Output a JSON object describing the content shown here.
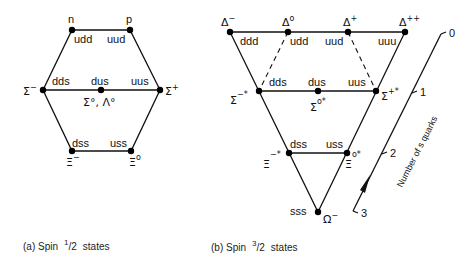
{
  "diagram_a": {
    "caption": {
      "prefix": "(a)  Spin",
      "numer": "1",
      "denom": "2",
      "suffix": "states"
    },
    "particles": {
      "n": "n",
      "p": "p",
      "sigma_minus": "Σ",
      "sigma_minus_sup": "−",
      "sigma_plus": "Σ",
      "sigma_plus_sup": "+",
      "sigma0_lambda0": "Σ°, Λ°",
      "xi_minus": "Ξ",
      "xi_minus_sup": "−",
      "xi_zero": "Ξ",
      "xi_zero_sup": "o"
    },
    "quarks": {
      "udd": "udd",
      "uud": "uud",
      "dds": "dds",
      "dus": "dus",
      "uus": "uus",
      "dss": "dss",
      "uss": "uss"
    }
  },
  "diagram_b": {
    "caption": {
      "prefix": "(b)  Spin",
      "numer": "3",
      "denom": "2",
      "suffix": "states"
    },
    "particles": {
      "delta_minus": "Δ",
      "delta_minus_sup": "−",
      "delta_zero": "Δ",
      "delta_zero_sup": "o",
      "delta_plus": "Δ",
      "delta_plus_sup": "+",
      "delta_pp": "Δ",
      "delta_pp_sup": "++",
      "sigma_minus_star": "Σ",
      "sigma_minus_star_sup": "−*",
      "sigma_zero_star": "Σ",
      "sigma_zero_star_sup": "o*",
      "sigma_plus_star": "Σ",
      "sigma_plus_star_sup": "+*",
      "xi_minus_star": "Ξ",
      "xi_minus_star_sup": "−*",
      "xi_zero_star": "Ξ",
      "xi_zero_star_sup": "o*",
      "omega_minus": "Ω",
      "omega_minus_sup": "−"
    },
    "quarks": {
      "ddd": "ddd",
      "udd": "udd",
      "uud": "uud",
      "uuu": "uuu",
      "dds": "dds",
      "dus": "dus",
      "uus": "uus",
      "dss": "dss",
      "uss": "uss",
      "sss": "sss"
    }
  },
  "strangeness_axis": {
    "label": "Number  of  s quarks",
    "ticks": [
      "0",
      "1",
      "2",
      "3"
    ]
  }
}
